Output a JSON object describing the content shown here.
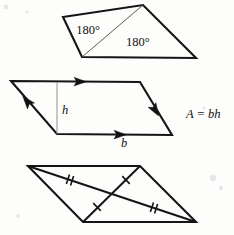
{
  "figure": {
    "background_color": "#fdfdfc",
    "ink_color": "#151515",
    "width": 234,
    "height": 235
  },
  "quadrilateral": {
    "name": "quadrilateral-split-into-two-triangles",
    "vertices": [
      [
        63,
        17
      ],
      [
        143,
        5
      ],
      [
        196,
        58
      ],
      [
        82,
        57
      ]
    ],
    "diagonal": [
      [
        143,
        5
      ],
      [
        82,
        57
      ]
    ],
    "labels": [
      {
        "text": "180°",
        "x": 88,
        "y": 34
      },
      {
        "text": "180°",
        "x": 126,
        "y": 46
      }
    ]
  },
  "parallelogram_area": {
    "name": "parallelogram-with-base-and-height",
    "vertices": [
      [
        11,
        81
      ],
      [
        140,
        82
      ],
      [
        172,
        135
      ],
      [
        57,
        134
      ]
    ],
    "height_segment": [
      [
        57,
        82
      ],
      [
        57,
        134
      ]
    ],
    "labels": {
      "height": "h",
      "height_x": 62,
      "height_y": 110,
      "base": "b",
      "base_x": 124,
      "base_y": 146,
      "formula": "A = bh",
      "formula_x": 186,
      "formula_y": 118
    },
    "arrow_marks": [
      {
        "name": "top-edge-arrow",
        "x": 74,
        "y": 81.5,
        "angle": 0.4
      },
      {
        "name": "bottom-edge-arrow",
        "x": 114,
        "y": 134.5,
        "angle": 0.5
      },
      {
        "name": "left-edge-arrow",
        "x": 31,
        "y": 105,
        "angle": -49
      },
      {
        "name": "right-edge-arrow",
        "x": 154,
        "y": 106,
        "angle": 121
      }
    ]
  },
  "parallelogram_diagonals": {
    "name": "parallelogram-with-bisecting-diagonals",
    "vertices": [
      [
        28,
        166
      ],
      [
        140,
        166
      ],
      [
        196,
        222
      ],
      [
        83,
        222
      ]
    ],
    "diagonals": [
      {
        "name": "diagonal-double-tick",
        "from": [
          28,
          166
        ],
        "to": [
          196,
          222
        ],
        "ticks": 2
      },
      {
        "name": "diagonal-single-tick",
        "from": [
          83,
          222
        ],
        "to": [
          140,
          166
        ],
        "ticks": 1
      }
    ],
    "tick_marks": [
      {
        "name": "tick-upper-left-double",
        "x": 70,
        "y": 180,
        "angle": 18,
        "count": 2
      },
      {
        "name": "tick-lower-right-double",
        "x": 154,
        "y": 208,
        "angle": 18,
        "count": 2
      },
      {
        "name": "tick-lower-left-single",
        "x": 97,
        "y": 208,
        "angle": -44,
        "count": 1
      },
      {
        "name": "tick-upper-right-single",
        "x": 126,
        "y": 180,
        "angle": -44,
        "count": 1
      }
    ]
  }
}
